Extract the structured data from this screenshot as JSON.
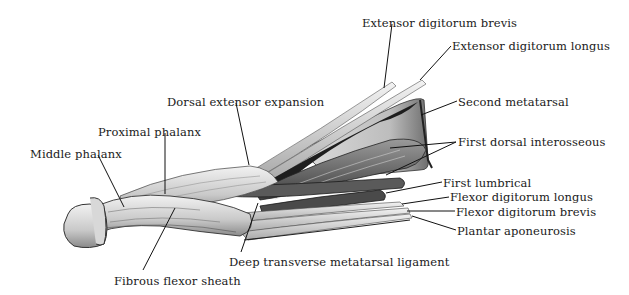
{
  "figure": {
    "labels": [
      {
        "id": "extensor-digitorum-brevis",
        "text": "Extensor digitorum brevis",
        "x": 362,
        "y": 18
      },
      {
        "id": "extensor-digitorum-longus",
        "text": "Extensor digitorum longus",
        "x": 452,
        "y": 41
      },
      {
        "id": "second-metatarsal",
        "text": "Second metatarsal",
        "x": 458,
        "y": 97
      },
      {
        "id": "dorsal-extensor-expansion",
        "text": "Dorsal extensor expansion",
        "x": 167,
        "y": 97
      },
      {
        "id": "first-dorsal-interosseous",
        "text": "First dorsal interosseous",
        "x": 458,
        "y": 137
      },
      {
        "id": "proximal-phalanx",
        "text": "Proximal phalanx",
        "x": 98,
        "y": 127
      },
      {
        "id": "middle-phalanx",
        "text": "Middle phalanx",
        "x": 30,
        "y": 149
      },
      {
        "id": "first-lumbrical",
        "text": "First lumbrical",
        "x": 443,
        "y": 178
      },
      {
        "id": "flexor-digitorum-longus",
        "text": "Flexor digitorum longus",
        "x": 450,
        "y": 192
      },
      {
        "id": "flexor-digitorum-brevis",
        "text": "Flexor digitorum brevis",
        "x": 456,
        "y": 207
      },
      {
        "id": "plantar-aponeurosis",
        "text": "Plantar aponeurosis",
        "x": 457,
        "y": 226
      },
      {
        "id": "deep-transverse-metatarsal-ligament",
        "text": "Deep transverse metatarsal ligament",
        "x": 229,
        "y": 257
      },
      {
        "id": "fibrous-flexor-sheath",
        "text": "Fibrous flexor sheath",
        "x": 114,
        "y": 276
      }
    ]
  },
  "colors": {
    "background": "#ffffff",
    "text": "#1a1a1a",
    "leader": "#111111",
    "bone_light": "#e6e6e6",
    "bone_mid": "#b5b5b5",
    "muscle_dark": "#3a3a3a",
    "tendon": "#d9d9d9"
  }
}
